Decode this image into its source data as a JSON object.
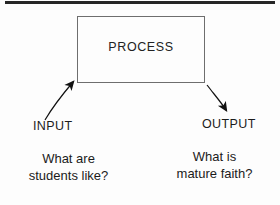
{
  "diagram": {
    "title_rule": "",
    "process": {
      "label": "PROCESS"
    },
    "flows": [
      {
        "id": "input",
        "label": "INPUT",
        "question": "What are\nstudents like?",
        "arrow": "curved-arrow-up-right"
      },
      {
        "id": "output",
        "label": "OUTPUT",
        "question": "What is\nmature faith?",
        "arrow": "curved-arrow-down-right"
      }
    ],
    "colors": {
      "background": "#fdfdfd",
      "ink": "#1b1b1b",
      "box_border": "#6e6e6e",
      "rule": "#262626",
      "arrow": "#111111"
    }
  }
}
